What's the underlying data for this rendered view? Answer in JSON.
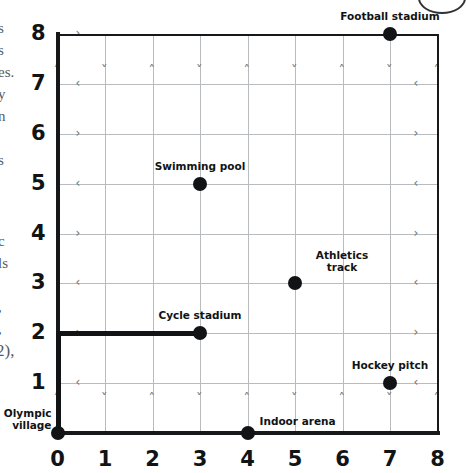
{
  "chart_data": {
    "type": "scatter",
    "title": "",
    "xlabel": "",
    "ylabel": "",
    "xlim": [
      0,
      8
    ],
    "ylim": [
      0,
      8
    ],
    "grid": true,
    "legend": "none",
    "x_ticks": [
      "0",
      "1",
      "2",
      "3",
      "4",
      "5",
      "6",
      "7",
      "8"
    ],
    "y_ticks": [
      "0",
      "1",
      "2",
      "3",
      "4",
      "5",
      "6",
      "7",
      "8"
    ],
    "points": [
      {
        "label": "Football stadium",
        "x": 7,
        "y": 8,
        "label_pos": "above",
        "lines": [
          "Football stadium"
        ]
      },
      {
        "label": "Swimming pool",
        "x": 3,
        "y": 5,
        "label_pos": "above",
        "lines": [
          "Swimming pool"
        ]
      },
      {
        "label": "Athletics track",
        "x": 5,
        "y": 3,
        "label_pos": "above-right",
        "lines": [
          "Athletics",
          "track"
        ]
      },
      {
        "label": "Cycle stadium",
        "x": 3,
        "y": 2,
        "label_pos": "above",
        "lines": [
          "Cycle stadium"
        ]
      },
      {
        "label": "Hockey pitch",
        "x": 7,
        "y": 1,
        "label_pos": "above",
        "lines": [
          "Hockey pitch"
        ]
      },
      {
        "label": "Indoor arena",
        "x": 4,
        "y": 0,
        "label_pos": "above-right",
        "lines": [
          "Indoor arena"
        ]
      },
      {
        "label": "Olympic village",
        "x": 0,
        "y": 0,
        "label_pos": "left",
        "lines": [
          "Olympic",
          "village"
        ]
      }
    ],
    "route": {
      "name": "route-from-olympic-village-to-cycle-stadium",
      "vertices": [
        [
          0,
          0
        ],
        [
          0,
          2
        ],
        [
          3,
          2
        ]
      ]
    },
    "colors": {
      "point": "#111314",
      "axis": "#17181a",
      "gridline": "#b9bcbe",
      "route": "#111314",
      "label_text": "#111314"
    }
  },
  "labels": {
    "football_stadium": "Football stadium",
    "swimming_pool": "Swimming pool",
    "athletics_track_l1": "Athletics",
    "athletics_track_l2": "track",
    "cycle_stadium": "Cycle stadium",
    "hockey_pitch": "Hockey pitch",
    "indoor_arena": "Indoor arena",
    "olympic_village_l1": "Olympic",
    "olympic_village_l2": "village"
  },
  "x_axis": {
    "t0": "0",
    "t1": "1",
    "t2": "2",
    "t3": "3",
    "t4": "4",
    "t5": "5",
    "t6": "6",
    "t7": "7",
    "t8": "8"
  },
  "y_axis": {
    "t1": "1",
    "t2": "2",
    "t3": "3",
    "t4": "4",
    "t5": "5",
    "t6": "6",
    "t7": "7",
    "t8": "8"
  },
  "margin_text": {
    "f1": "s",
    "f2": "s",
    "f3": "es.",
    "f4": "y",
    "f5": "n",
    "f6": "s",
    "f7": "c",
    "f8": "ls",
    "f9": ",",
    "f10": ",",
    "f11": "2),"
  }
}
